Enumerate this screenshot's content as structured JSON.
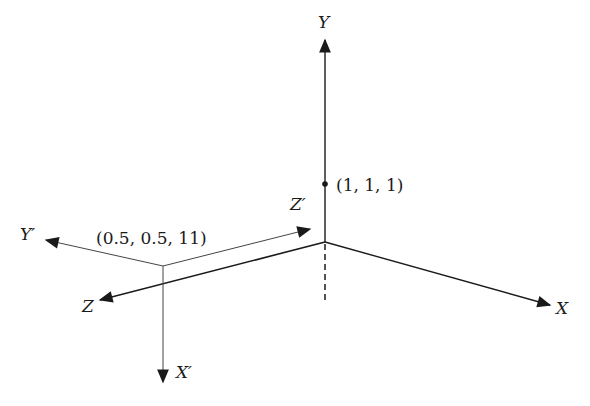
{
  "diagram": {
    "type": "3d-coordinate-frames",
    "colors": {
      "line": "#1a1a1a",
      "secondary_line": "#555555",
      "background": "#ffffff"
    },
    "world_frame": {
      "origin_px": [
        325,
        242
      ],
      "axes": [
        {
          "name": "Y",
          "label": "Y",
          "tip_px": [
            325,
            38
          ]
        },
        {
          "name": "X",
          "label": "X",
          "tip_px": [
            552,
            306
          ]
        },
        {
          "name": "Z",
          "label": "Z",
          "tip_px": [
            98,
            301
          ]
        }
      ],
      "negative_y_dashed_end_px": [
        325,
        300
      ]
    },
    "camera_frame": {
      "origin_px": [
        163,
        266
      ],
      "axes": [
        {
          "name": "Y'",
          "label": "Y′",
          "tip_px": [
            44,
            240
          ]
        },
        {
          "name": "X'",
          "label": "X′",
          "tip_px": [
            163,
            384
          ]
        },
        {
          "name": "Z'",
          "label": "Z′",
          "tip_px": [
            312,
            228
          ]
        }
      ]
    },
    "points": [
      {
        "label": "(1, 1, 1)",
        "px": [
          325,
          184
        ]
      }
    ],
    "annotations": [
      {
        "label": "(0.5, 0.5, 11)",
        "px": [
          96,
          244
        ]
      }
    ]
  }
}
